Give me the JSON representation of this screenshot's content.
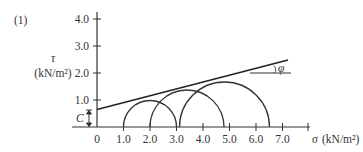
{
  "figure": {
    "label": "(1)",
    "y_axis": {
      "symbol": "τ",
      "unit": "(kN/m²)",
      "ticks": [
        {
          "value": 1.0,
          "label": "1.0"
        },
        {
          "value": 2.0,
          "label": "2.0"
        },
        {
          "value": 3.0,
          "label": "3.0"
        },
        {
          "value": 4.0,
          "label": "4.0"
        }
      ]
    },
    "x_axis": {
      "symbol": "σ",
      "unit": "(kN/m²)",
      "label": "σ (kN/m²)",
      "ticks": [
        {
          "value": 0,
          "label": "0"
        },
        {
          "value": 1.0,
          "label": "1.0"
        },
        {
          "value": 2.0,
          "label": "2.0"
        },
        {
          "value": 3.0,
          "label": "3.0"
        },
        {
          "value": 4.0,
          "label": "4.0"
        },
        {
          "value": 5.0,
          "label": "5.0"
        },
        {
          "value": 6.0,
          "label": "6.0"
        },
        {
          "value": 7.0,
          "label": "7.0"
        }
      ]
    },
    "annotations": {
      "cohesion": "C",
      "friction_angle": "φ"
    },
    "mohr_circles": [
      {
        "sigma3": 1.0,
        "sigma1": 3.0
      },
      {
        "sigma3": 2.0,
        "sigma1": 4.8
      },
      {
        "sigma3": 3.1,
        "sigma1": 6.5
      }
    ],
    "failure_envelope": {
      "intercept_c": 0.65,
      "x_end": 7.2,
      "y_end": 2.5
    }
  }
}
